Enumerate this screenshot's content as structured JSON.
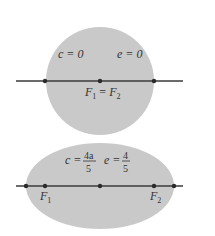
{
  "colors": {
    "fill": "#c9c9c9",
    "line": "#3a3a3a",
    "point": "#2a2a2a",
    "text": "#333333",
    "background": "#ffffff"
  },
  "circle_figure": {
    "label_c": "c = 0",
    "label_e": "e = 0",
    "focus_label": "F",
    "focus_sub1": "1",
    "equals": " = ",
    "focus_sub2": "2"
  },
  "ellipse_figure": {
    "label_c_prefix": "c = ",
    "label_c_num": "4a",
    "label_c_den": "5",
    "label_e_prefix": "e = ",
    "label_e_num": "4",
    "label_e_den": "5",
    "focus1_label": "F",
    "focus1_sub": "1",
    "focus2_label": "F",
    "focus2_sub": "2"
  }
}
